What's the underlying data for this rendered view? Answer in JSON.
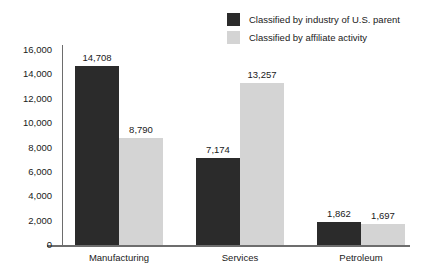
{
  "chart_data": {
    "type": "bar",
    "title": "",
    "subtitle": "",
    "xlabel": "",
    "ylabel": "",
    "categories": [
      "Manufacturing",
      "Services",
      "Petroleum"
    ],
    "series": [
      {
        "name": "Classified by industry of U.S. parent",
        "color": "#2b2b2b",
        "values": [
          14708,
          7174,
          1862
        ],
        "labels": [
          "14,708",
          "7,174",
          "1,862"
        ]
      },
      {
        "name": "Classified by affiliate activity",
        "color": "#d4d4d4",
        "values": [
          8790,
          13257,
          1697
        ],
        "labels": [
          "8,790",
          "13,257",
          "1,697"
        ]
      }
    ],
    "ylim": [
      0,
      16000
    ],
    "ytick_values": [
      0,
      2000,
      4000,
      6000,
      8000,
      10000,
      12000,
      14000,
      16000
    ],
    "ytick_labels": [
      "0",
      "2,000",
      "4,000",
      "6,000",
      "8,000",
      "10,000",
      "12,000",
      "14,000",
      "16,000"
    ],
    "grid": false,
    "legend_position": "top-right",
    "axis_color": "#6d6d6d"
  }
}
